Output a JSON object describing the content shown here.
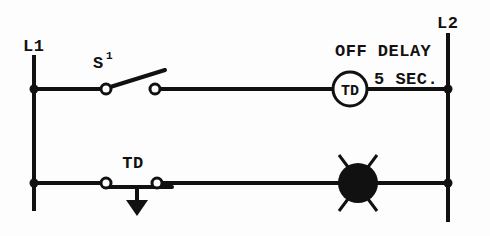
{
  "diagram": {
    "type": "ladder-logic",
    "background_color": "#fdfdfd",
    "line_color": "#111111",
    "rails": {
      "left": {
        "label": "L1",
        "x": 34
      },
      "right": {
        "label": "L2",
        "x": 448
      }
    },
    "rungs": [
      {
        "name": "rung-1",
        "y": 89,
        "components": [
          {
            "kind": "contact-no",
            "label": "S",
            "superscript": "1"
          },
          {
            "kind": "coil-timer",
            "label": "TD"
          }
        ],
        "annotations": [
          {
            "text": "OFF DELAY"
          },
          {
            "text": "5 SEC."
          }
        ]
      },
      {
        "name": "rung-2",
        "y": 183,
        "components": [
          {
            "kind": "contact-nc-timed",
            "label": "TD",
            "arrow": "down"
          },
          {
            "kind": "pilot-lamp",
            "label": ""
          }
        ],
        "annotations": []
      }
    ],
    "labels": {
      "l1": "L1",
      "l2": "L2",
      "switch": "S",
      "switch_sup": "1",
      "coil": "TD",
      "off_delay": "OFF DELAY",
      "delay_time": "5 SEC.",
      "contact_td": "TD"
    }
  }
}
